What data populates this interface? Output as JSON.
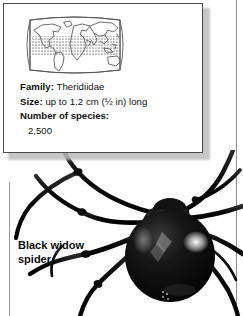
{
  "page": {
    "background_color": "#ffffff",
    "rule_color": "#8d8d8d"
  },
  "info_card": {
    "border_color": "#4a4a4a",
    "background_color": "#ffffff",
    "map": {
      "icon_name": "world-map-distribution",
      "band_label": "",
      "band_fill_color": "#b9b9b9",
      "outline_color": "#6a6a6a"
    },
    "facts": [
      {
        "label": "Family:",
        "value": "Theridiidae"
      },
      {
        "label": "Size:",
        "value": "up to 1.2 cm (½ in) long"
      }
    ],
    "species": {
      "label": "Number of species:",
      "value": "2,500"
    }
  },
  "caption": {
    "line1": "Black widow",
    "line2": "spider"
  },
  "illustration": {
    "name": "black-widow-spider-photo",
    "body_color": "#0b0b0b",
    "highlight_color": "#f2f2f2"
  }
}
